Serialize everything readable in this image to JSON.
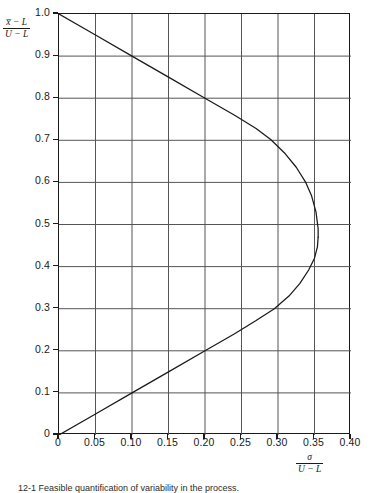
{
  "figure": {
    "caption": "12-1  Feasible quantification of variability in the process."
  },
  "axes": {
    "y_label_numerator": "x̅ − L",
    "y_label_denominator": "U − L",
    "x_label_numerator": "σ",
    "x_label_denominator": "U − L",
    "y_ticks": [
      "1.0",
      "0.9",
      "0.8",
      "0.7",
      "0.6",
      "0.5",
      "0.4",
      "0.3",
      "0.2",
      "0.1",
      "0"
    ],
    "x_ticks": [
      "0",
      "0.05",
      "0.10",
      "0.15",
      "0.20",
      "0.25",
      "0.30",
      "0.35",
      "0.40"
    ]
  },
  "chart_data": {
    "type": "line",
    "title": "",
    "xlabel": "σ / (U − L)",
    "ylabel": "(x̅ − L) / (U − L)",
    "xlim": [
      0,
      0.4
    ],
    "ylim": [
      0,
      1.0
    ],
    "xticks": [
      0,
      0.05,
      0.1,
      0.15,
      0.2,
      0.25,
      0.3,
      0.35,
      0.4
    ],
    "yticks": [
      0,
      0.1,
      0.2,
      0.3,
      0.4,
      0.5,
      0.6,
      0.7,
      0.8,
      0.9,
      1.0
    ],
    "grid": true,
    "legend": "none",
    "grid_color": "#555555",
    "curve_color": "#1a1a1a",
    "max_sigma_ratio": 0.355,
    "max_sigma_at_y": 0.47,
    "series": [
      {
        "name": "upper-branch",
        "note": "starts at (0, 1.0), linear y = 1 - x near origin, bends right toward vertex",
        "points": [
          [
            0.0,
            1.0
          ],
          [
            0.05,
            0.95
          ],
          [
            0.1,
            0.9
          ],
          [
            0.15,
            0.85
          ],
          [
            0.2,
            0.8
          ],
          [
            0.24,
            0.76
          ],
          [
            0.27,
            0.728
          ],
          [
            0.29,
            0.702
          ],
          [
            0.31,
            0.668
          ],
          [
            0.325,
            0.636
          ],
          [
            0.338,
            0.6
          ],
          [
            0.346,
            0.568
          ],
          [
            0.352,
            0.53
          ],
          [
            0.355,
            0.49
          ],
          [
            0.355,
            0.47
          ]
        ]
      },
      {
        "name": "lower-branch",
        "note": "starts at (0, 0), linear y = x near origin, bends right toward vertex",
        "points": [
          [
            0.0,
            0.0
          ],
          [
            0.05,
            0.05
          ],
          [
            0.1,
            0.1
          ],
          [
            0.15,
            0.15
          ],
          [
            0.2,
            0.2
          ],
          [
            0.24,
            0.24
          ],
          [
            0.27,
            0.272
          ],
          [
            0.295,
            0.3
          ],
          [
            0.315,
            0.33
          ],
          [
            0.33,
            0.36
          ],
          [
            0.342,
            0.392
          ],
          [
            0.35,
            0.42
          ],
          [
            0.354,
            0.447
          ],
          [
            0.355,
            0.47
          ]
        ]
      }
    ]
  }
}
